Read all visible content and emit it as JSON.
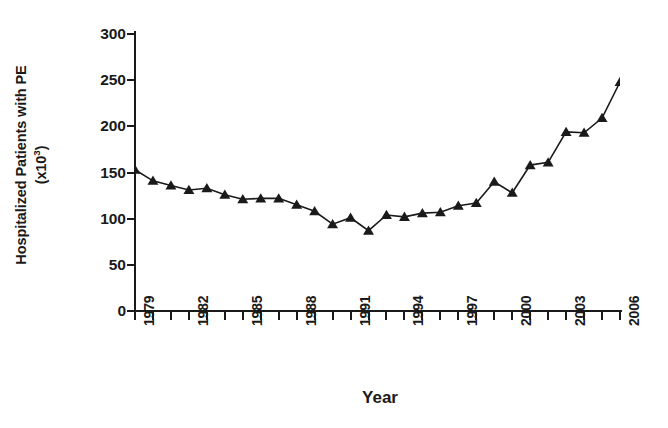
{
  "chart_data": {
    "type": "line",
    "title": "",
    "xlabel": "Year",
    "ylabel": "Hospitalized Patients with PE (x10^3)",
    "ylabel_line1": "Hospitalized Patients with PE",
    "ylabel_line2_prefix": "(x10",
    "ylabel_line2_sup": "3",
    "ylabel_line2_suffix": ")",
    "xlim": [
      1979,
      2006
    ],
    "ylim": [
      0,
      300
    ],
    "ytick_values": [
      300,
      250,
      200,
      150,
      100,
      50,
      0
    ],
    "ytick_labels": [
      "300",
      "250",
      "200",
      "150",
      "100",
      "50",
      "0"
    ],
    "xtick_labels": [
      "1979",
      "1982",
      "1985",
      "1988",
      "1991",
      "1994",
      "1997",
      "2000",
      "2003",
      "2006"
    ],
    "xtick_label_years": [
      1979,
      1982,
      1985,
      1988,
      1991,
      1994,
      1997,
      2000,
      2003,
      2006
    ],
    "x": [
      1979,
      1980,
      1981,
      1982,
      1983,
      1984,
      1985,
      1986,
      1987,
      1988,
      1989,
      1990,
      1991,
      1992,
      1993,
      1994,
      1995,
      1996,
      1997,
      1998,
      1999,
      2000,
      2001,
      2002,
      2003,
      2004,
      2005,
      2006
    ],
    "values": [
      153,
      141,
      136,
      131,
      133,
      126,
      121,
      122,
      122,
      115,
      108,
      94,
      101,
      87,
      104,
      102,
      106,
      107,
      114,
      117,
      140,
      128,
      158,
      161,
      194,
      193,
      209,
      248
    ],
    "series": [
      {
        "name": "Hospitalized Patients with PE",
        "values": [
          153,
          141,
          136,
          131,
          133,
          126,
          121,
          122,
          122,
          115,
          108,
          94,
          101,
          87,
          104,
          102,
          106,
          107,
          114,
          117,
          140,
          128,
          158,
          161,
          194,
          193,
          209,
          248
        ]
      }
    ],
    "marker": "triangle",
    "marker_color": "#1a1a1a",
    "line_color": "#1a1a1a",
    "grid": false,
    "legend": false,
    "legend_position": "none"
  }
}
